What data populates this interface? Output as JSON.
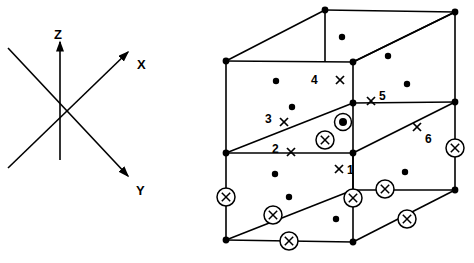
{
  "figure": {
    "stroke_color": "#000000",
    "background_color": "#ffffff"
  },
  "axes": {
    "name": "coordinate-axis-triad",
    "origin": {
      "x": 60,
      "y": 108
    },
    "labels": [
      {
        "id": "z",
        "text": "Z",
        "x": 54,
        "y": 28
      },
      {
        "id": "x",
        "text": "X",
        "x": 137,
        "y": 58
      },
      {
        "id": "y",
        "text": "Y",
        "x": 136,
        "y": 184
      }
    ],
    "arrows": [
      {
        "id": "z-axis",
        "x1": 60,
        "y1": 160,
        "x2": 60,
        "y2": 42,
        "arrow": true
      },
      {
        "id": "x-axis",
        "x1": 8,
        "y1": 168,
        "x2": 128,
        "y2": 52,
        "arrow": true
      },
      {
        "id": "y-axis",
        "x1": 8,
        "y1": 48,
        "x2": 128,
        "y2": 176,
        "arrow": true
      }
    ]
  },
  "cell": {
    "name": "unit-cell-cube",
    "vertices": [
      {
        "id": "v-top-back-left",
        "x": 325,
        "y": 10
      },
      {
        "id": "v-top-back-right",
        "x": 455,
        "y": 12
      },
      {
        "id": "v-top-front-left",
        "x": 226,
        "y": 61
      },
      {
        "id": "v-top-front-right",
        "x": 353,
        "y": 62
      },
      {
        "id": "v-mid-back-right",
        "x": 455,
        "y": 102
      },
      {
        "id": "v-mid-front-left",
        "x": 226,
        "y": 153
      },
      {
        "id": "v-mid-front-right",
        "x": 353,
        "y": 103
      },
      {
        "id": "v-mid-center",
        "x": 353,
        "y": 153
      },
      {
        "id": "v-bot-back-right",
        "x": 455,
        "y": 190
      },
      {
        "id": "v-bot-front-left",
        "x": 226,
        "y": 240
      },
      {
        "id": "v-bot-front-right",
        "x": 353,
        "y": 242
      }
    ],
    "edges": [
      {
        "id": "e-top-back",
        "x1": 325,
        "y1": 10,
        "x2": 455,
        "y2": 12
      },
      {
        "id": "e-top-left-diag",
        "x1": 226,
        "y1": 61,
        "x2": 325,
        "y2": 10
      },
      {
        "id": "e-top-right-diag",
        "x1": 353,
        "y1": 62,
        "x2": 455,
        "y2": 12
      },
      {
        "id": "e-top-front",
        "x1": 226,
        "y1": 61,
        "x2": 353,
        "y2": 62
      },
      {
        "id": "e-top-front-ext",
        "x1": 353,
        "y1": 62,
        "x2": 455,
        "y2": 12
      },
      {
        "id": "e-vert-back-left",
        "x1": 325,
        "y1": 10,
        "x2": 325,
        "y2": 62
      },
      {
        "id": "e-vert-back-right",
        "x1": 455,
        "y1": 12,
        "x2": 455,
        "y2": 190
      },
      {
        "id": "e-vert-front-left",
        "x1": 226,
        "y1": 61,
        "x2": 226,
        "y2": 240
      },
      {
        "id": "e-vert-front-mid",
        "x1": 353,
        "y1": 62,
        "x2": 353,
        "y2": 242
      },
      {
        "id": "e-mid-left-diag",
        "x1": 226,
        "y1": 153,
        "x2": 353,
        "y2": 103
      },
      {
        "id": "e-mid-front",
        "x1": 226,
        "y1": 153,
        "x2": 353,
        "y2": 153
      },
      {
        "id": "e-mid-right-diag",
        "x1": 353,
        "y1": 153,
        "x2": 455,
        "y2": 102
      },
      {
        "id": "e-mid-right-horiz",
        "x1": 353,
        "y1": 103,
        "x2": 455,
        "y2": 102
      },
      {
        "id": "e-bot-left-diag",
        "x1": 226,
        "y1": 240,
        "x2": 353,
        "y2": 190
      },
      {
        "id": "e-bot-front",
        "x1": 226,
        "y1": 240,
        "x2": 353,
        "y2": 242
      },
      {
        "id": "e-bot-right-diag",
        "x1": 353,
        "y1": 242,
        "x2": 455,
        "y2": 190
      },
      {
        "id": "e-bot-right-horiz",
        "x1": 353,
        "y1": 190,
        "x2": 455,
        "y2": 190
      },
      {
        "id": "e-vert-mid-right",
        "x1": 353,
        "y1": 153,
        "x2": 353,
        "y2": 190
      }
    ]
  },
  "markers": {
    "filled_dots": [
      {
        "id": "dot-1",
        "x": 342,
        "y": 37
      },
      {
        "id": "dot-2",
        "x": 388,
        "y": 56
      },
      {
        "id": "dot-3",
        "x": 276,
        "y": 81
      },
      {
        "id": "dot-4",
        "x": 407,
        "y": 84
      },
      {
        "id": "dot-5",
        "x": 292,
        "y": 107
      },
      {
        "id": "dot-6",
        "x": 275,
        "y": 174
      },
      {
        "id": "dot-7",
        "x": 405,
        "y": 172
      },
      {
        "id": "dot-8",
        "x": 289,
        "y": 197
      },
      {
        "id": "dot-9",
        "x": 336,
        "y": 219
      }
    ],
    "circled_x": [
      {
        "id": "circled-x-1",
        "x": 325,
        "y": 140
      },
      {
        "id": "circled-x-2",
        "x": 226,
        "y": 197
      },
      {
        "id": "circled-x-3",
        "x": 455,
        "y": 148
      },
      {
        "id": "circled-x-4",
        "x": 385,
        "y": 189
      },
      {
        "id": "circled-x-5",
        "x": 273,
        "y": 215
      },
      {
        "id": "circled-x-6",
        "x": 353,
        "y": 198
      },
      {
        "id": "circled-x-7",
        "x": 407,
        "y": 219
      },
      {
        "id": "circled-x-8",
        "x": 289,
        "y": 241
      }
    ],
    "circled_dot": [
      {
        "id": "circled-dot-1",
        "x": 343,
        "y": 122
      }
    ],
    "plain_x": [
      {
        "id": "x-mark-1",
        "x": 340,
        "y": 80
      },
      {
        "id": "x-mark-2",
        "x": 371,
        "y": 101
      },
      {
        "id": "x-mark-3",
        "x": 284,
        "y": 122
      },
      {
        "id": "x-mark-4",
        "x": 291,
        "y": 152
      },
      {
        "id": "x-mark-5",
        "x": 339,
        "y": 169
      },
      {
        "id": "x-mark-6",
        "x": 417,
        "y": 127
      }
    ],
    "site_labels": [
      {
        "id": "site-label-4",
        "text": "4",
        "x": 311,
        "y": 74
      },
      {
        "id": "site-label-5",
        "text": "5",
        "x": 379,
        "y": 90
      },
      {
        "id": "site-label-3",
        "text": "3",
        "x": 265,
        "y": 113
      },
      {
        "id": "site-label-6",
        "text": "6",
        "x": 425,
        "y": 133
      },
      {
        "id": "site-label-2",
        "text": "2",
        "x": 272,
        "y": 143
      },
      {
        "id": "site-label-1",
        "text": "1",
        "x": 347,
        "y": 164
      }
    ]
  }
}
